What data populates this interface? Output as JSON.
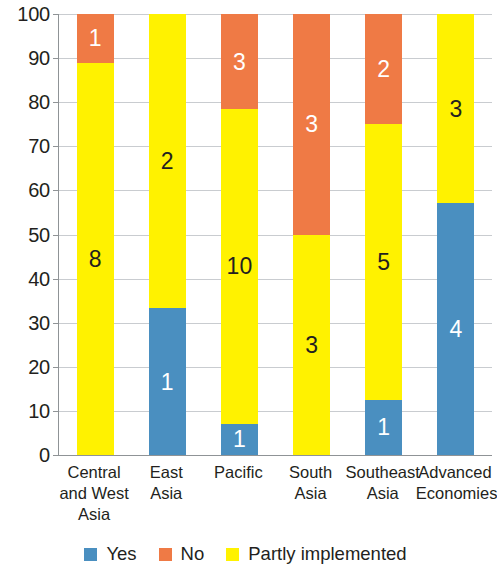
{
  "chart_data": {
    "type": "bar",
    "subtype": "stacked-100-percent",
    "title": "",
    "xlabel": "",
    "ylabel": "",
    "ylim": [
      0,
      100
    ],
    "yticks": [
      0,
      10,
      20,
      30,
      40,
      50,
      60,
      70,
      80,
      90,
      100
    ],
    "ytick_labels": [
      "0",
      "10",
      "20",
      "30",
      "40",
      "50",
      "60",
      "70",
      "80",
      "90",
      "100"
    ],
    "grid": true,
    "legend_position": "bottom",
    "categories": [
      "Central and West Asia",
      "East Asia",
      "Pacific",
      "South Asia",
      "Southeast Asia",
      "Advanced Economies"
    ],
    "category_label_lines": [
      [
        "Central",
        "and West",
        "Asia"
      ],
      [
        "East",
        "Asia"
      ],
      [
        "Pacific"
      ],
      [
        "South",
        "Asia"
      ],
      [
        "Southeast",
        "Asia"
      ],
      [
        "Advanced",
        "Economies"
      ]
    ],
    "series": [
      {
        "name": "Yes",
        "color": "#4a8fc0",
        "values": [
          0,
          1,
          1,
          0,
          1,
          4
        ],
        "percents": [
          0,
          33.3,
          7.1,
          0,
          12.5,
          57.1
        ],
        "labels": [
          "",
          "1",
          "1",
          "",
          "1",
          "4"
        ],
        "label_color": "#ffffff"
      },
      {
        "name": "No",
        "color": "#ef7a45",
        "values": [
          1,
          0,
          3,
          3,
          2,
          0
        ],
        "percents": [
          11.1,
          0,
          21.4,
          50.0,
          25.0,
          0
        ],
        "labels": [
          "1",
          "",
          "3",
          "3",
          "2",
          ""
        ],
        "label_color": "#ffffff"
      },
      {
        "name": "Partly implemented",
        "color": "#fff200",
        "values": [
          8,
          2,
          10,
          3,
          5,
          3
        ],
        "percents": [
          88.9,
          66.7,
          71.4,
          50.0,
          62.5,
          42.9
        ],
        "labels": [
          "8",
          "2",
          "10",
          "3",
          "5",
          "3"
        ],
        "label_color": "#231f20"
      }
    ],
    "totals": [
      9,
      3,
      14,
      6,
      8,
      7
    ]
  },
  "legend": {
    "items": [
      {
        "label": "Yes",
        "color": "#4a8fc0"
      },
      {
        "label": "No",
        "color": "#ef7a45"
      },
      {
        "label": "Partly implemented",
        "color": "#fff200"
      }
    ]
  },
  "colors": {
    "yes": "#4a8fc0",
    "no": "#ef7a45",
    "partly": "#fff200",
    "axis": "#8f9396",
    "grid": "#c9ccd0",
    "text": "#231f20",
    "background": "#ffffff"
  }
}
